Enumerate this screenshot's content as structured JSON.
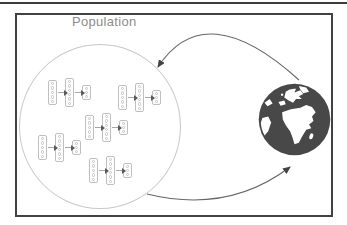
{
  "figure": {
    "population": {
      "label": "Population",
      "individual_count": 5,
      "individuals": [
        {
          "x": 48,
          "y": 78
        },
        {
          "x": 118,
          "y": 83
        },
        {
          "x": 85,
          "y": 113
        },
        {
          "x": 38,
          "y": 133
        },
        {
          "x": 89,
          "y": 156
        }
      ],
      "individual_layer_dots": [
        5,
        6,
        3
      ]
    },
    "environment": {
      "icon": "globe-earth-icon"
    },
    "arrows": {
      "environment_to_population": "curved-arrow-pointing-at-population-circle",
      "population_to_environment": "curved-arrow-pointing-at-globe"
    },
    "colors": {
      "top_rule": "#3c3c3c",
      "frame_border": "#424242",
      "circle_border": "#c8c8c8",
      "label": "#8c8c8c",
      "unit_border": "#bfbfbf",
      "unit_dot": "#c4c4c4",
      "mini_arrow_line": "#a8a8a8",
      "mini_arrow_head": "#5a5a5a",
      "curve": "#666666",
      "curve_head": "#444444",
      "globe": "#484848"
    }
  }
}
